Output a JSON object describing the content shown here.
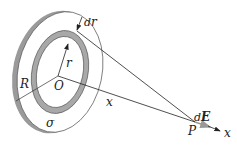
{
  "diagram": {
    "labels": {
      "dr_d": "d",
      "dr_r": "r",
      "r": "r",
      "R": "R",
      "O": "O",
      "x": "x",
      "sigma": "σ",
      "P": "P",
      "dE_d": "d",
      "dE_E": "E",
      "x_axis": "x"
    },
    "colors": {
      "line": "#2a2a2a",
      "ring_fill": "#a8a8a8",
      "disk_edge": "#9a9a9a",
      "field_arrow": "#9a9a9a",
      "background": "#ffffff"
    }
  }
}
